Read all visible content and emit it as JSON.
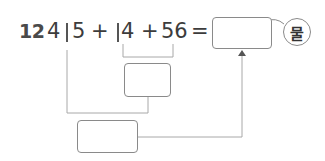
{
  "problem": {
    "number": "12",
    "tokens": [
      "4",
      "5",
      "+",
      "4",
      "+",
      "56",
      "="
    ],
    "expression_text": "415 + 14 + 56 =",
    "unit_badge": "물"
  },
  "boxes": {
    "answer": "",
    "middle": "",
    "bottom": ""
  },
  "colors": {
    "line": "#a8a8a8",
    "box_border": "#8a8a8a",
    "text": "#3c3c3c"
  }
}
